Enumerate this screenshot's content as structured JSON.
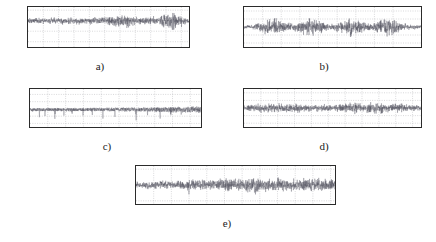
{
  "figure": {
    "type": "multi-panel-signal-figure",
    "panel_count": 5,
    "background_color": "#ffffff",
    "trace_color": "#4a4a58",
    "axis_color": "#2b2b2b",
    "grid_color": "#9a9aa0"
  },
  "chart_data": [
    {
      "id": "a",
      "type": "line",
      "caption": "a)",
      "title": "",
      "xlabel": "",
      "ylabel": "",
      "xlim": [
        0,
        2.1
      ],
      "ylim": [
        -0.25,
        0.13
      ],
      "grid": true,
      "legend": "none",
      "xticks": [
        "0.2",
        "0.4",
        "0.6",
        "0.8",
        "1",
        "1.2",
        "1.4",
        "1.6",
        "1.8",
        "2"
      ],
      "xtick_values": [
        0.2,
        0.4,
        0.6,
        0.8,
        1.0,
        1.2,
        1.4,
        1.6,
        1.8,
        2.0
      ],
      "yticks": [
        "0.1",
        "0",
        "-0.1",
        "-0.2"
      ],
      "ytick_values": [
        0.1,
        0,
        -0.1,
        -0.2
      ],
      "series": [
        {
          "name": "signal-a",
          "description": "dense noise burst waveform, baseline near 0, amplitude envelope grows near x=1.2 and x=1.8",
          "envelope_x": [
            0.0,
            0.15,
            0.3,
            0.45,
            0.6,
            0.75,
            0.9,
            1.05,
            1.15,
            1.25,
            1.4,
            1.55,
            1.7,
            1.8,
            1.9,
            2.0,
            2.1
          ],
          "envelope_y": [
            0.035,
            0.04,
            0.038,
            0.042,
            0.04,
            0.038,
            0.042,
            0.05,
            0.075,
            0.09,
            0.05,
            0.045,
            0.055,
            0.095,
            0.11,
            0.06,
            0.04
          ]
        }
      ]
    },
    {
      "id": "b",
      "type": "line",
      "caption": "b)",
      "title": "",
      "xlabel": "",
      "ylabel": "",
      "xlim": [
        0,
        19000
      ],
      "ylim": [
        -0.5,
        0.5
      ],
      "grid": true,
      "legend": "none",
      "xticks": [
        "2000",
        "4000",
        "6000",
        "8000",
        "10000",
        "12000",
        "14000",
        "16000"
      ],
      "xtick_values": [
        2000,
        4000,
        6000,
        8000,
        10000,
        12000,
        14000,
        16000
      ],
      "yticks": [
        "0.4",
        "0.2",
        "0",
        "-0.2",
        "-0.4"
      ],
      "ytick_values": [
        0.4,
        0.2,
        0,
        -0.2,
        -0.4
      ],
      "series": [
        {
          "name": "signal-b",
          "description": "burst-modulated noise; four amplitude bursts centred near 3000, 7000, 11500 and 15000 samples",
          "envelope_x": [
            0,
            1000,
            2200,
            3000,
            4200,
            5200,
            6200,
            7000,
            8200,
            9200,
            10200,
            11500,
            12500,
            13500,
            14500,
            15200,
            16500,
            17500,
            19000
          ],
          "envelope_y": [
            0.05,
            0.07,
            0.22,
            0.3,
            0.22,
            0.1,
            0.2,
            0.3,
            0.2,
            0.08,
            0.16,
            0.3,
            0.18,
            0.1,
            0.22,
            0.32,
            0.2,
            0.1,
            0.06
          ]
        }
      ]
    },
    {
      "id": "c",
      "type": "line",
      "caption": "c)",
      "title": "",
      "xlabel": "",
      "ylabel": "",
      "xlim": [
        0,
        4800
      ],
      "ylim": [
        -2.1,
        -1.05
      ],
      "grid": true,
      "legend": "none",
      "xticks": [
        "500",
        "1000",
        "1500",
        "2000",
        "2500",
        "3000",
        "3500",
        "4000",
        "4500"
      ],
      "xtick_values": [
        500,
        1000,
        1500,
        2000,
        2500,
        3000,
        3500,
        4000,
        4500
      ],
      "yticks": [
        "-1.2",
        "-1.4",
        "-1.6",
        "-1.8",
        "-2"
      ],
      "ytick_values": [
        -1.2,
        -1.4,
        -1.6,
        -1.8,
        -2.0
      ],
      "series": [
        {
          "name": "signal-c",
          "description": "negative-offset noise floor near -1.65 with sparse downward impulsive spikes reaching about -2",
          "baseline": -1.62,
          "spike_positions": [
            260,
            420,
            700,
            950,
            1180,
            1480,
            1750,
            2050,
            2380,
            2700,
            2980,
            3300,
            3650,
            3950,
            4250,
            4520
          ],
          "spike_depth": [
            -1.95,
            -1.88,
            -2.0,
            -1.92,
            -1.85,
            -2.0,
            -1.9,
            -2.0,
            -1.93,
            -1.88,
            -1.97,
            -1.9,
            -1.96,
            -1.9,
            -2.0,
            -1.93
          ]
        }
      ]
    },
    {
      "id": "d",
      "type": "line",
      "caption": "d)",
      "title": "",
      "xlabel": "",
      "ylabel": "",
      "xlim": [
        0,
        2.1
      ],
      "ylim": [
        -0.5,
        0.5
      ],
      "grid": true,
      "legend": "none",
      "xticks": [
        "0.2",
        "0.4",
        "0.6",
        "0.8",
        "1",
        "1.2",
        "1.4",
        "1.6",
        "1.8",
        "2"
      ],
      "xtick_values": [
        0.2,
        0.4,
        0.6,
        0.8,
        1.0,
        1.2,
        1.4,
        1.6,
        1.8,
        2.0
      ],
      "yticks": [
        "0.4",
        "0.2",
        "0",
        "-0.2",
        "-0.4"
      ],
      "ytick_values": [
        0.4,
        0.2,
        0,
        -0.2,
        -0.4
      ],
      "series": [
        {
          "name": "signal-d",
          "description": "zero-mean noise with mild amplitude modulation; small bursts near 0.3, 0.6, 1.3 and 1.55",
          "envelope_x": [
            0.0,
            0.15,
            0.3,
            0.45,
            0.6,
            0.75,
            0.9,
            1.05,
            1.2,
            1.3,
            1.45,
            1.55,
            1.7,
            1.85,
            2.0,
            2.1
          ],
          "envelope_y": [
            0.08,
            0.14,
            0.18,
            0.13,
            0.19,
            0.12,
            0.14,
            0.1,
            0.16,
            0.2,
            0.14,
            0.22,
            0.13,
            0.16,
            0.11,
            0.08
          ]
        }
      ]
    },
    {
      "id": "e",
      "type": "line",
      "caption": "e)",
      "title": "",
      "xlabel": "",
      "ylabel": "",
      "xlim": [
        0,
        2.25
      ],
      "ylim": [
        -0.6,
        0.6
      ],
      "grid": true,
      "legend": "none",
      "xticks": [
        "0.2",
        "0.4",
        "0.6",
        "0.8",
        "1",
        "1.2",
        "1.4",
        "1.6",
        "1.8",
        "2",
        "2.2"
      ],
      "xtick_values": [
        0.2,
        0.4,
        0.6,
        0.8,
        1.0,
        1.2,
        1.4,
        1.6,
        1.8,
        2.0,
        2.2
      ],
      "yticks": [
        "0.5",
        "0",
        "-0.5"
      ],
      "ytick_values": [
        0.5,
        0,
        -0.5
      ],
      "series": [
        {
          "name": "signal-e",
          "description": "broadband zero-mean noise with increasing amplitude after x=0.6 and sustained activity to x=2.2",
          "envelope_x": [
            0.0,
            0.15,
            0.3,
            0.45,
            0.6,
            0.75,
            0.9,
            1.05,
            1.2,
            1.35,
            1.5,
            1.65,
            1.8,
            1.95,
            2.1,
            2.25
          ],
          "envelope_y": [
            0.14,
            0.15,
            0.16,
            0.17,
            0.24,
            0.22,
            0.2,
            0.3,
            0.26,
            0.32,
            0.24,
            0.3,
            0.28,
            0.26,
            0.3,
            0.18
          ]
        }
      ]
    }
  ]
}
